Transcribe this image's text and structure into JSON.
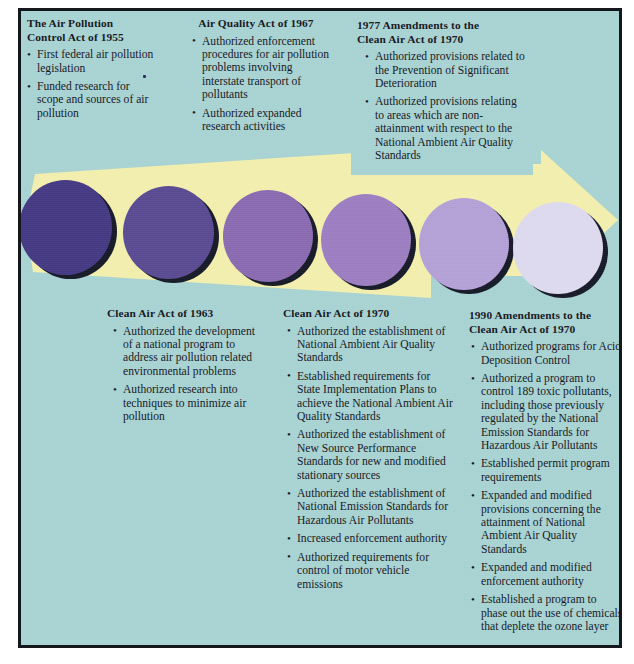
{
  "diagram": {
    "type": "timeline-arrow",
    "colors": {
      "background_teal": "#a9d3d3",
      "arrow_yellow": "#f3efae",
      "frame_border": "#14181c",
      "text": "#16181f",
      "circles": [
        "#453a84",
        "#5a4b93",
        "#8a6bb1",
        "#9d7fc2",
        "#b4a1d7",
        "#dedaef"
      ]
    },
    "markers": [
      {
        "index": 1,
        "color": "#453a84",
        "label": "1955"
      },
      {
        "index": 2,
        "color": "#5a4b93",
        "label": "1963"
      },
      {
        "index": 3,
        "color": "#8a6bb1",
        "label": "1967"
      },
      {
        "index": 4,
        "color": "#9d7fc2",
        "label": "1970"
      },
      {
        "index": 5,
        "color": "#b4a1d7",
        "label": "1977"
      },
      {
        "index": 6,
        "color": "#dedaef",
        "label": "1990"
      }
    ]
  },
  "blocks": {
    "act_1955": {
      "title": "The Air Pollution\nControl Act of 1955",
      "title_lines": [
        "The Air Pollution",
        "Control Act of 1955"
      ],
      "bullets": [
        "First federal air pollution legislation",
        "Funded research for scope and sources of air pollution"
      ]
    },
    "act_1967": {
      "title": "Air Quality Act of 1967",
      "title_lines": [
        "Air Quality Act of 1967"
      ],
      "bullets": [
        "Authorized enforcement procedures for air pollution problems involving interstate transport of pollutants",
        "Authorized expanded research activities"
      ]
    },
    "amend_1977": {
      "title": "1977 Amendments to the\nClean Air Act of 1970",
      "title_lines": [
        "1977 Amendments to the",
        "Clean Air Act of 1970"
      ],
      "bullets": [
        "Authorized provisions related to the Prevention of Significant Deterioration",
        "Authorized provisions relating to areas which are non-attainment with respect to the National Ambient Air Quality Standards"
      ]
    },
    "act_1963": {
      "title": "Clean Air Act of 1963",
      "title_lines": [
        "Clean Air Act of 1963"
      ],
      "bullets": [
        "Authorized the development of a national program to address air pollution related environmental problems",
        "Authorized research into techniques to minimize air pollution"
      ]
    },
    "act_1970": {
      "title": "Clean Air Act of 1970",
      "title_lines": [
        "Clean Air Act of 1970"
      ],
      "bullets": [
        "Authorized the establishment of National Ambient Air Quality Standards",
        "Established requirements for State Implementation Plans to achieve the National Ambient Air Quality Standards",
        "Authorized the establishment of New Source Performance Standards for new and modified stationary sources",
        "Authorized the establishment of National Emission Standards for Hazardous Air Pollutants",
        "Increased enforcement authority",
        "Authorized requirements for control of motor vehicle emissions"
      ]
    },
    "amend_1990": {
      "title": "1990 Amendments to the\nClean Air Act of 1970",
      "title_lines": [
        "1990 Amendments to the",
        "Clean Air Act of 1970"
      ],
      "bullets": [
        "Authorized programs for Acid Deposition Control",
        "Authorized a program to control 189 toxic pollutants, including those previously regulated by the National Emission Standards for Hazardous Air Pollutants",
        "Established permit program requirements",
        "Expanded and modified provisions concerning the attainment of National Ambient Air Quality Standards",
        "Expanded and modified enforcement authority",
        "Established a program to phase out the use of chemicals that deplete the ozone layer"
      ]
    }
  }
}
